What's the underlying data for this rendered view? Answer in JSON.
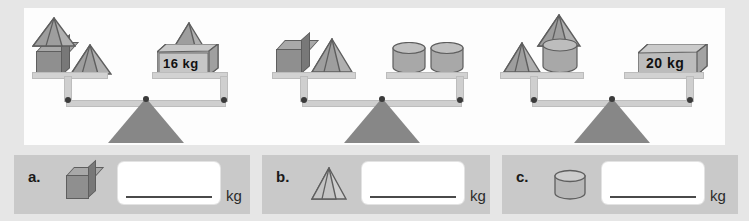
{
  "worksheet": {
    "background_color": "#e6e6e6",
    "panel_color": "#fdfdfd",
    "strip_color": "#c9c9c9"
  },
  "balances": [
    {
      "id": "balance-a",
      "left_pan": {
        "groups": [
          {
            "shapes": [
              "cube",
              "pyramid-on-top"
            ]
          },
          {
            "shapes": [
              "pyramid"
            ]
          }
        ]
      },
      "right_pan": {
        "groups": [
          {
            "shapes": [
              "pyramid",
              "weight-box"
            ]
          }
        ],
        "weight_label": "16 kg"
      },
      "state": "balanced"
    },
    {
      "id": "balance-b",
      "left_pan": {
        "groups": [
          {
            "shapes": [
              "cube"
            ]
          },
          {
            "shapes": [
              "pyramid"
            ]
          }
        ]
      },
      "right_pan": {
        "groups": [
          {
            "shapes": [
              "cylinder"
            ]
          },
          {
            "shapes": [
              "cylinder"
            ]
          }
        ]
      },
      "state": "balanced"
    },
    {
      "id": "balance-c",
      "left_pan": {
        "groups": [
          {
            "shapes": [
              "pyramid"
            ]
          },
          {
            "shapes": [
              "cylinder",
              "pyramid-on-top"
            ]
          }
        ]
      },
      "right_pan": {
        "groups": [
          {
            "shapes": [
              "weight-box"
            ]
          }
        ],
        "weight_label": "20 kg"
      },
      "state": "balanced"
    }
  ],
  "weights": {
    "box_16": "16 kg",
    "box_20": "20 kg"
  },
  "questions": [
    {
      "letter": "a.",
      "shape": "cube",
      "value": "",
      "placeholder": "",
      "unit": "kg"
    },
    {
      "letter": "b.",
      "shape": "pyramid",
      "value": "",
      "placeholder": "",
      "unit": "kg"
    },
    {
      "letter": "c.",
      "shape": "cylinder",
      "value": "",
      "placeholder": "",
      "unit": "kg"
    }
  ],
  "colors": {
    "shape_face": "#9a9a9a",
    "shape_light": "#b4b4b4",
    "shape_dark": "#7c7c7c",
    "outline": "#5e5e5e",
    "fulcrum": "#878787",
    "beam": "#cfcfcf"
  }
}
